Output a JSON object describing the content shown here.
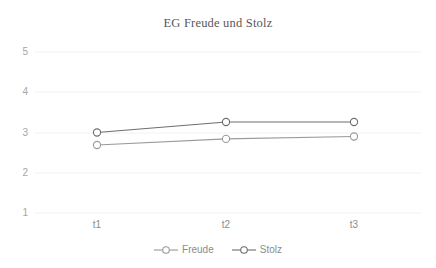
{
  "chart_data": {
    "type": "line",
    "title": "EG Freude und Stolz",
    "xlabel": "",
    "ylabel": "",
    "categories": [
      "t1",
      "t2",
      "t3"
    ],
    "ylim": [
      1,
      5
    ],
    "yticks": [
      1,
      2,
      3,
      4,
      5
    ],
    "grid": true,
    "legend_position": "bottom",
    "series": [
      {
        "name": "Freude",
        "values": [
          2.69,
          2.84,
          2.9
        ],
        "color": "#9a9a9a",
        "marker": "open-circle"
      },
      {
        "name": "Stolz",
        "values": [
          3.0,
          3.26,
          3.26
        ],
        "color": "#6e6e6e",
        "marker": "open-circle"
      }
    ]
  },
  "axis": {
    "y_tick_labels": [
      "5",
      "4",
      "3",
      "2",
      "1"
    ],
    "x_tick_labels": [
      "t1",
      "t2",
      "t3"
    ]
  },
  "legend": {
    "items": [
      {
        "label": "Freude"
      },
      {
        "label": "Stolz"
      }
    ]
  },
  "colors": {
    "title": "#585858",
    "gridline": "#f2f2f2",
    "y_tick": "#a6a6a6",
    "x_tick": "#8c8c8c",
    "series_freude": "#9a9a9a",
    "series_stolz": "#6e6e6e",
    "background": "#ffffff"
  }
}
